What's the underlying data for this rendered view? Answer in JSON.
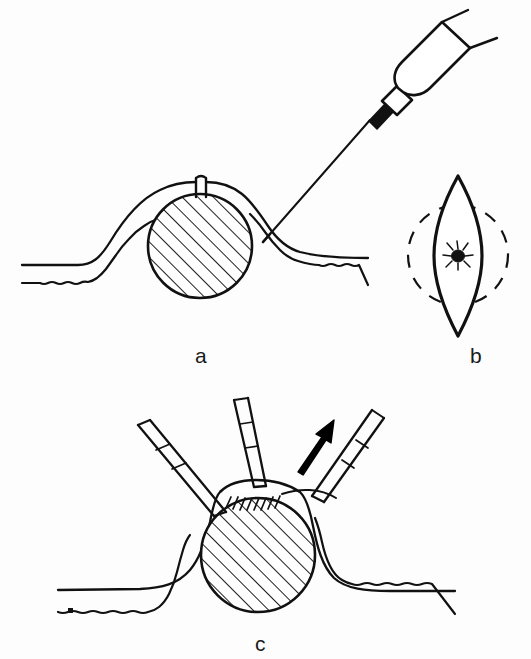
{
  "figure": {
    "background_color": "#fdfdfd",
    "ink_color": "#111111",
    "panel_count": 3
  },
  "panels": [
    {
      "id": "a",
      "label": "a",
      "caption_text": "a",
      "description": "Cross-section of skin with embedded tick; hypodermic needle and syringe injecting local anesthetic beside the tick",
      "elements": [
        "skin-surface-line",
        "dermis-wavy-line",
        "tick-body-hatched-circle",
        "tick-mouthparts-notch",
        "syringe-barrel",
        "syringe-hub",
        "needle-shaft",
        "needle-tip"
      ]
    },
    {
      "id": "b",
      "label": "b",
      "caption_text": "b",
      "description": "Top view: elliptical (fusiform) excision outline around tick with dashed circle marking the planned margin",
      "elements": [
        "ellipse-incision-outline",
        "dashed-margin-circle",
        "tick-top-view"
      ]
    },
    {
      "id": "c",
      "label": "c",
      "caption_text": "c",
      "description": "Excised skin ellipse with embedded tick lifted with three forceps; arrow shows direction of upward traction",
      "elements": [
        "skin-surface-line",
        "dermis-wavy-line",
        "tick-body-hatched-circle",
        "forceps-left",
        "forceps-center",
        "forceps-right",
        "traction-arrow",
        "suture-hatch-marks"
      ]
    }
  ],
  "labels": {
    "a": "a",
    "b": "b",
    "c": "c"
  },
  "colors": {
    "ink": "#111111",
    "paper": "#fdfdfd",
    "fill_solid": "#000000"
  },
  "geometry": {
    "panel_a": {
      "tick_center": [
        200,
        246
      ],
      "tick_radius": 53,
      "hatch_angle_deg": 45,
      "needle_angle_deg": 55
    },
    "panel_b": {
      "ellipse_center": [
        458,
        255
      ],
      "ellipse_half_width": 24,
      "ellipse_half_height": 80,
      "dashed_circle_center": [
        458,
        255
      ],
      "dashed_circle_radius": 50
    },
    "panel_c": {
      "tick_center": [
        258,
        555
      ],
      "tick_radius": 58,
      "hatch_angle_deg": 45,
      "arrow_angle_deg": 55
    }
  }
}
